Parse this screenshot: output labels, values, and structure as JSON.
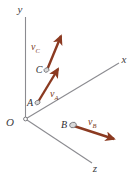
{
  "figure": {
    "name": "3d-axes-velocity-vectors",
    "background_color": "#ffffff",
    "axis_color": "#8b8b90",
    "vector_color": "#8b3a21",
    "point_fill_color": "#d9d9d9",
    "point_stroke_color": "#6e6e73",
    "label_color": "#3d3d42"
  },
  "axes": {
    "y": {
      "label": "y"
    },
    "x": {
      "label": "x"
    },
    "z": {
      "label": "z"
    },
    "origin": {
      "label": "O"
    }
  },
  "points": [
    {
      "id": "A",
      "label": "A"
    },
    {
      "id": "B",
      "label": "B"
    },
    {
      "id": "C",
      "label": "C"
    }
  ],
  "vectors": [
    {
      "id": "vA",
      "label_base": "v",
      "label_sub": "A",
      "from_point": "A",
      "direction": "up-right"
    },
    {
      "id": "vB",
      "label_base": "v",
      "label_sub": "B",
      "from_point": "B",
      "direction": "right-down"
    },
    {
      "id": "vC",
      "label_base": "v",
      "label_sub": "C",
      "from_point": "C",
      "direction": "up-right-steep"
    }
  ]
}
